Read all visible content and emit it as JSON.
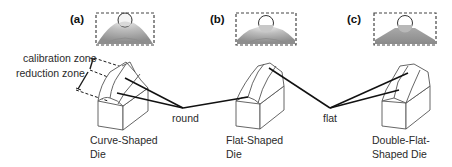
{
  "panels": [
    {
      "id": "a",
      "label": "(a)",
      "die_name_line1": "Curve-Shaped",
      "die_name_line2": "Die"
    },
    {
      "id": "b",
      "label": "(b)",
      "die_name_line1": "Flat-Shaped",
      "die_name_line2": "Die"
    },
    {
      "id": "c",
      "label": "(c)",
      "die_name_line1": "Double-Flat-",
      "die_name_line2": "Shaped Die"
    }
  ],
  "zones": {
    "calibration": "calibration zone",
    "reduction": "reduction zone"
  },
  "callouts": {
    "round": "round",
    "flat": "flat"
  },
  "colors": {
    "line": "#1a1a1a",
    "dashed_box": "#444444",
    "inset_fill_dark": "#9a9a9a",
    "inset_fill_light": "#d6d6d6",
    "die_outline": "#555555"
  }
}
